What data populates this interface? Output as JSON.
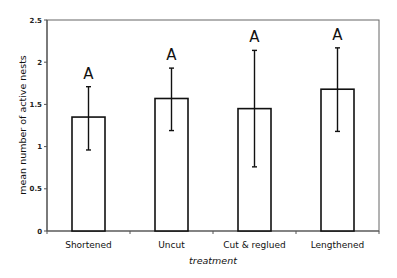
{
  "chart_data": {
    "type": "bar",
    "title": "",
    "xlabel": "treatment",
    "ylabel": "mean number of active nests",
    "ylim": [
      0,
      2.5
    ],
    "yticks": [
      0,
      0.5,
      1,
      1.5,
      2,
      2.5
    ],
    "ytick_labels": [
      "0",
      "0.5",
      "1",
      "1.5",
      "2",
      "2.5"
    ],
    "categories": [
      "Shortened",
      "Uncut",
      "Cut & reglued",
      "Lengthened"
    ],
    "values": [
      1.35,
      1.57,
      1.45,
      1.68
    ],
    "error_upper": [
      1.71,
      1.93,
      2.14,
      2.17
    ],
    "error_lower": [
      0.96,
      1.19,
      0.76,
      1.18
    ],
    "significance_letters": [
      "A",
      "A",
      "A",
      "A"
    ],
    "grid": false,
    "bar_fill": "#ffffff",
    "bar_stroke": "#111111"
  }
}
